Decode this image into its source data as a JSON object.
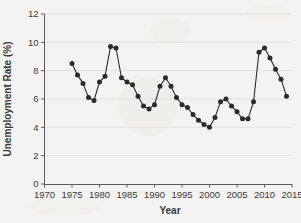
{
  "chart_data": {
    "type": "line",
    "title": "",
    "subtitle": "",
    "xlabel": "Year",
    "ylabel": "Unemployment Rate (%)",
    "xlim": [
      1970,
      2015
    ],
    "ylim": [
      0,
      12
    ],
    "xticks": [
      1970,
      1975,
      1980,
      1985,
      1990,
      1995,
      2000,
      2005,
      2010,
      2015
    ],
    "yticks": [
      0,
      2,
      4,
      6,
      8,
      10,
      12
    ],
    "grid": "horizontal",
    "legend": "none",
    "marker": "filled-circle",
    "series_color": "#2b2b2b",
    "x": [
      1975,
      1976,
      1977,
      1978,
      1979,
      1980,
      1981,
      1982,
      1983,
      1984,
      1985,
      1986,
      1987,
      1988,
      1989,
      1990,
      1991,
      1992,
      1993,
      1994,
      1995,
      1996,
      1997,
      1998,
      1999,
      2000,
      2001,
      2002,
      2003,
      2004,
      2005,
      2006,
      2007,
      2008,
      2009,
      2010,
      2011,
      2012,
      2013,
      2014
    ],
    "values": [
      8.5,
      7.7,
      7.1,
      6.1,
      5.9,
      7.2,
      7.6,
      9.7,
      9.6,
      7.5,
      7.2,
      7.0,
      6.2,
      5.5,
      5.3,
      5.6,
      6.9,
      7.5,
      6.9,
      6.1,
      5.6,
      5.4,
      4.9,
      4.5,
      4.2,
      4.0,
      4.7,
      5.8,
      6.0,
      5.5,
      5.1,
      4.6,
      4.6,
      5.8,
      9.3,
      9.6,
      8.9,
      8.1,
      7.4,
      6.2
    ],
    "series": [
      {
        "name": "Unemployment Rate",
        "values": [
          8.5,
          7.7,
          7.1,
          6.1,
          5.9,
          7.2,
          7.6,
          9.7,
          9.6,
          7.5,
          7.2,
          7.0,
          6.2,
          5.5,
          5.3,
          5.6,
          6.9,
          7.5,
          6.9,
          6.1,
          5.6,
          5.4,
          4.9,
          4.5,
          4.2,
          4.0,
          4.7,
          5.8,
          6.0,
          5.5,
          5.1,
          4.6,
          4.6,
          5.8,
          9.3,
          9.6,
          8.9,
          8.1,
          7.4,
          6.2
        ]
      }
    ]
  },
  "axes": {
    "y_title": "Unemployment Rate (%)",
    "x_title": "Year",
    "y_tick_labels": [
      "0",
      "2",
      "4",
      "6",
      "8",
      "10",
      "12"
    ],
    "x_tick_labels": [
      "1970",
      "1975",
      "1980",
      "1985",
      "1990",
      "1995",
      "2000",
      "2005",
      "2010",
      "2015"
    ]
  },
  "colors": {
    "background": "#f4f3f1",
    "line": "#2b2b2b",
    "marker": "#2b2b2b",
    "grid": "#e2e0dd",
    "axis": "#5a5a5a",
    "text": "#3a3a3a"
  }
}
